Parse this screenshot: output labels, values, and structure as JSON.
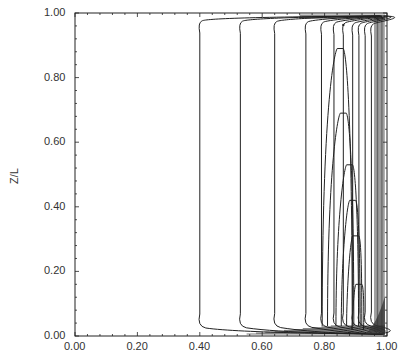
{
  "chart_data": {
    "type": "contour",
    "title": "",
    "xlabel": "",
    "ylabel": "Z/L",
    "xlim": [
      0.0,
      1.0
    ],
    "ylim": [
      0.0,
      1.0
    ],
    "grid": false,
    "legend": null,
    "x_ticks": [
      "0.00",
      "0.20",
      "0.40",
      "0.60",
      "0.80",
      "1.00"
    ],
    "y_ticks": [
      "0.00",
      "0.20",
      "0.40",
      "0.60",
      "0.80",
      "1.00"
    ],
    "contour_levels_x_positions": [
      0.4,
      0.53,
      0.64,
      0.74,
      0.79,
      0.83,
      0.86,
      0.89,
      0.91,
      0.93,
      0.95
    ],
    "inner_peaks": [
      {
        "x": 0.85,
        "peak_y": 0.89
      },
      {
        "x": 0.86,
        "peak_y": 0.69
      },
      {
        "x": 0.88,
        "peak_y": 0.53
      },
      {
        "x": 0.89,
        "peak_y": 0.42
      },
      {
        "x": 0.9,
        "peak_y": 0.31
      },
      {
        "x": 0.91,
        "peak_y": 0.16
      }
    ]
  },
  "axes": {
    "ylabel": "Z/L",
    "x_tick_labels": [
      "0.00",
      "0.20",
      "0.40",
      "0.60",
      "0.80",
      "1.00"
    ],
    "y_tick_labels": [
      "1.00",
      "0.80",
      "0.60",
      "0.40",
      "0.20",
      "0.00"
    ]
  }
}
